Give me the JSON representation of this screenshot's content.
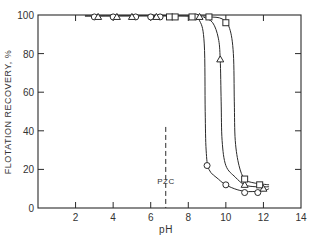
{
  "chart_data": {
    "type": "line",
    "title": "",
    "xlabel": "pH",
    "ylabel": "FLOTATION RECOVERY, %",
    "xlim": [
      0,
      14
    ],
    "ylim": [
      0,
      100
    ],
    "x_ticks": [
      2,
      4,
      6,
      8,
      10,
      12,
      14
    ],
    "y_ticks": [
      0,
      20,
      40,
      60,
      80,
      100
    ],
    "grid": false,
    "legend": null,
    "annotations": [
      {
        "text": "PZC",
        "x": 6.8,
        "y": 15,
        "type": "dashed-vertical-line",
        "line_x": 6.8,
        "line_y_range": [
          0,
          42
        ]
      }
    ],
    "series": [
      {
        "name": "circles",
        "marker": "circle",
        "points": [
          [
            3.0,
            99
          ],
          [
            4.0,
            99
          ],
          [
            5.2,
            99
          ],
          [
            6.0,
            99
          ],
          [
            6.5,
            99
          ],
          [
            8.4,
            99
          ],
          [
            9.0,
            22
          ],
          [
            10.0,
            12
          ],
          [
            11.0,
            8
          ],
          [
            11.7,
            8
          ]
        ],
        "curve": [
          [
            2.5,
            99.5
          ],
          [
            8.0,
            99.5
          ],
          [
            8.6,
            97
          ],
          [
            8.85,
            85
          ],
          [
            8.9,
            50
          ],
          [
            8.95,
            30
          ],
          [
            9.1,
            20
          ],
          [
            9.6,
            15
          ],
          [
            10.0,
            12
          ],
          [
            10.6,
            9.5
          ],
          [
            11.2,
            8.5
          ],
          [
            12.0,
            9
          ],
          [
            12.3,
            10
          ]
        ]
      },
      {
        "name": "triangles",
        "marker": "triangle",
        "points": [
          [
            3.2,
            99
          ],
          [
            4.2,
            99
          ],
          [
            5.0,
            99
          ],
          [
            6.3,
            99
          ],
          [
            8.6,
            99
          ],
          [
            9.7,
            77
          ],
          [
            11.0,
            12
          ],
          [
            12.0,
            10
          ]
        ],
        "curve": [
          [
            8.8,
            99
          ],
          [
            9.3,
            96
          ],
          [
            9.6,
            88
          ],
          [
            9.7,
            77
          ],
          [
            9.75,
            55
          ],
          [
            9.8,
            35
          ],
          [
            10.0,
            22
          ],
          [
            10.5,
            16
          ],
          [
            11.0,
            12
          ],
          [
            11.6,
            11
          ],
          [
            12.3,
            11
          ]
        ]
      },
      {
        "name": "squares",
        "marker": "square",
        "points": [
          [
            7.0,
            99
          ],
          [
            7.3,
            99
          ],
          [
            8.2,
            99
          ],
          [
            9.1,
            99
          ],
          [
            10.0,
            96
          ],
          [
            11.0,
            15
          ],
          [
            11.8,
            12
          ]
        ],
        "curve": [
          [
            9.2,
            99
          ],
          [
            9.8,
            98
          ],
          [
            10.2,
            93
          ],
          [
            10.4,
            80
          ],
          [
            10.45,
            55
          ],
          [
            10.5,
            35
          ],
          [
            10.7,
            22
          ],
          [
            11.0,
            15
          ],
          [
            11.5,
            13
          ],
          [
            12.3,
            12
          ]
        ]
      }
    ]
  },
  "axes": {
    "ylabel": "FLOTATION RECOVERY, %",
    "xlabel": "pH",
    "x_tick_labels": [
      "2",
      "4",
      "6",
      "8",
      "10",
      "12",
      "14"
    ],
    "y_tick_labels": [
      "0",
      "20",
      "40",
      "60",
      "80",
      "100"
    ]
  },
  "annotation": {
    "pzc_label": "PZC"
  },
  "colors": {
    "ink": "#2a2a2a",
    "background": "#ffffff"
  }
}
